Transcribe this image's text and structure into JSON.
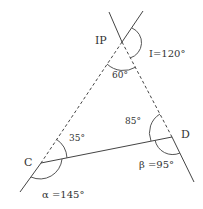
{
  "diagram": {
    "type": "geometry-traverse-intersection",
    "points": {
      "IP": {
        "label": "IP",
        "x": 122,
        "y": 42
      },
      "C": {
        "label": "C",
        "x": 41,
        "y": 163
      },
      "D": {
        "label": "D",
        "x": 172,
        "y": 137
      }
    },
    "angles": {
      "I": {
        "label": "I=120°"
      },
      "ip_interior": {
        "label": "60°"
      },
      "c_interior": {
        "label": "35°"
      },
      "d_interior": {
        "label": "85°"
      },
      "alpha": {
        "label": "α =145°"
      },
      "beta": {
        "label": "β =95°"
      }
    },
    "colors": {
      "line": "#444444",
      "text": "#333333"
    }
  }
}
